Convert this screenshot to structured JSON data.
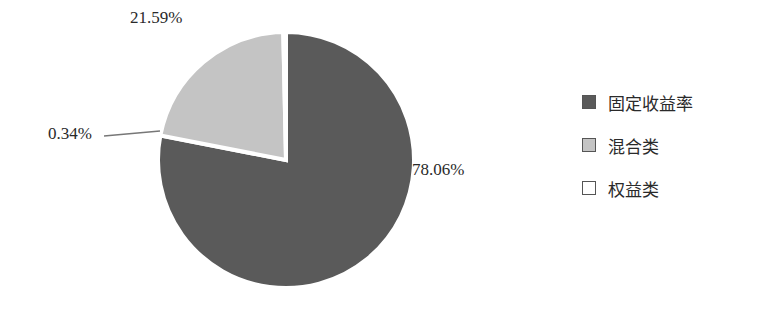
{
  "chart_data": {
    "type": "pie",
    "title": "",
    "categories": [
      "固定收益率",
      "混合类",
      "权益类"
    ],
    "values": [
      78.06,
      21.59,
      0.34
    ],
    "labels": [
      "78.06%",
      "21.59%",
      "0.34%"
    ],
    "colors": [
      "#5a5a5a",
      "#c4c4c4",
      "#ffffff"
    ],
    "start_angle_deg": 0,
    "direction": "clockwise",
    "legend_position": "right"
  },
  "legend": {
    "items": [
      {
        "label": "固定收益率",
        "color": "#5a5a5a"
      },
      {
        "label": "混合类",
        "color": "#c4c4c4"
      },
      {
        "label": "权益类",
        "color": "#ffffff"
      }
    ]
  },
  "data_labels": {
    "fixed_income": "78.06%",
    "mixed": "21.59%",
    "equity": "0.34%"
  }
}
